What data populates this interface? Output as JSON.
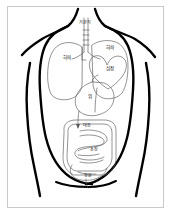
{
  "diagram": {
    "language": "ko",
    "view": "front",
    "line_color": "#000000",
    "organ_line_color": "#555555",
    "background": "#ffffff",
    "frame_color": "#c9c9c9"
  },
  "labels": {
    "bronchi": "기관지",
    "lung_left": "허파",
    "lung_right": "허파",
    "heart": "심장",
    "stomach": "위",
    "large_intestine": "대장",
    "small_intestine": "소장",
    "rectum": "항문"
  },
  "organs": [
    {
      "key": "bronchi",
      "label": "기관지",
      "x": 85,
      "y": 22
    },
    {
      "key": "lung_right",
      "label": "허파",
      "x": 67,
      "y": 58
    },
    {
      "key": "lung_left",
      "label": "허파",
      "x": 110,
      "y": 48
    },
    {
      "key": "heart",
      "label": "심장",
      "x": 110,
      "y": 69
    },
    {
      "key": "stomach",
      "label": "위",
      "x": 90,
      "y": 97
    },
    {
      "key": "large_intestine",
      "label": "대장",
      "x": 87,
      "y": 126
    },
    {
      "key": "small_intestine",
      "label": "소장",
      "x": 94,
      "y": 150
    },
    {
      "key": "rectum",
      "label": "항문",
      "x": 88,
      "y": 176
    }
  ]
}
